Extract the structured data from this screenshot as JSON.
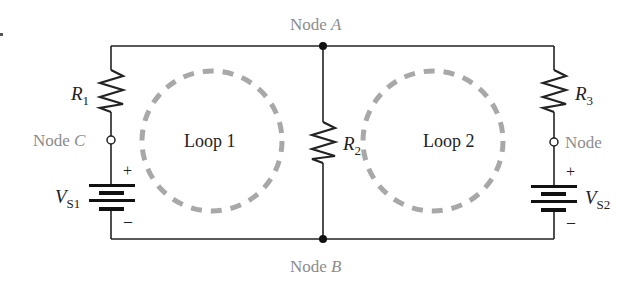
{
  "diagram": {
    "type": "circuit-schematic",
    "nodes": {
      "a": {
        "prefix": "Node",
        "letter": "A"
      },
      "b": {
        "prefix": "Node",
        "letter": "B"
      },
      "c": {
        "prefix": "Node",
        "letter": "C"
      },
      "d": {
        "prefix": "Node",
        "letter": ""
      }
    },
    "loops": {
      "loop1": "Loop 1",
      "loop2": "Loop 2"
    },
    "resistors": {
      "r1": {
        "sym": "R",
        "sub": "1"
      },
      "r2": {
        "sym": "R",
        "sub": "2"
      },
      "r3": {
        "sym": "R",
        "sub": "3"
      }
    },
    "sources": {
      "vs1": {
        "sym": "V",
        "sub": "S1",
        "plus": "+",
        "minus": "–"
      },
      "vs2": {
        "sym": "V",
        "sub": "S2",
        "plus": "+",
        "minus": "–"
      }
    },
    "colors": {
      "wire": "#222222",
      "label": "#222222",
      "node_label": "#8c8c8c",
      "loop_dash": "#a8a8a8"
    }
  }
}
